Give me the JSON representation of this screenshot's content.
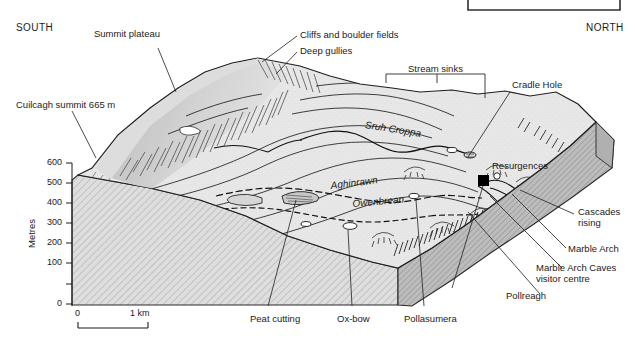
{
  "diagram": {
    "title_box": "",
    "compass": {
      "south": "SOUTH",
      "north": "NORTH"
    },
    "axis": {
      "title": "Metres",
      "ticks": [
        "600",
        "500",
        "400",
        "300",
        "200",
        "100",
        "0"
      ],
      "tick_values": [
        600,
        500,
        400,
        300,
        200,
        100,
        0
      ]
    },
    "scalebar": {
      "start": "0",
      "end": "1 km"
    },
    "labels": {
      "summit_plateau": "Summit plateau",
      "cuilcagh_summit": "Cuilcagh summit 665 m",
      "cliffs_boulder": "Cliffs and boulder fields",
      "deep_gullies": "Deep gullies",
      "stream_sinks": "Stream sinks",
      "cradle_hole": "Cradle Hole",
      "resurgences": "Resurgences",
      "cascades_rising": "Cascades\nrising",
      "marble_arch": "Marble Arch",
      "marble_arch_caves": "Marble Arch Caves\nvisitor centre",
      "pollreagh": "Pollreagh",
      "pollasumera": "Pollasumera",
      "ox_bow": "Ox-bow",
      "peat_cutting": "Peat cutting"
    },
    "rivers": {
      "sruh_croppa": "Sruh Croppa",
      "aghinrawn": "Aghinrawn",
      "owenbrean": "Owenbrean"
    },
    "colors": {
      "plateau_fill": "#e6e6e6",
      "front_face": "#dcdcdc",
      "side_face": "#b4b4b4",
      "ink": "#1b1b1b",
      "marker": "#000000"
    }
  }
}
